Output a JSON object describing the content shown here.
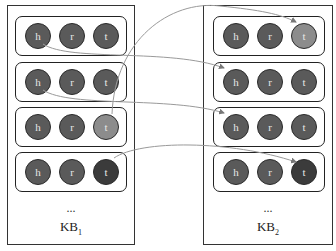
{
  "colors": {
    "normal": "#5a5a5a",
    "highlight": "#8c8c8c",
    "dark": "#3b3b3b",
    "link": "#9a9a9a"
  },
  "kb1": {
    "label_main": "KB",
    "label_sub": "1",
    "ellipsis": "...",
    "triples": [
      {
        "h": "h",
        "r": "r",
        "t": "t"
      },
      {
        "h": "h",
        "r": "r",
        "t": "t"
      },
      {
        "h": "h",
        "r": "r",
        "t": "t"
      },
      {
        "h": "h",
        "r": "r",
        "t": "t"
      }
    ]
  },
  "kb2": {
    "label_main": "KB",
    "label_sub": "2",
    "ellipsis": "...",
    "triples": [
      {
        "h": "h",
        "r": "r",
        "t": "t"
      },
      {
        "h": "h",
        "r": "r",
        "t": "t"
      },
      {
        "h": "h",
        "r": "r",
        "t": "t"
      },
      {
        "h": "h",
        "r": "r",
        "t": "t"
      }
    ]
  },
  "links": [
    {
      "from": "kb1.triple1.h",
      "to": "kb2.triple2.h"
    },
    {
      "from": "kb1.triple2.h",
      "to": "kb2.triple3.h"
    },
    {
      "from": "kb1.triple3.t",
      "to": "kb2.triple1.t"
    },
    {
      "from": "kb1.triple4.t",
      "to": "kb2.triple4.t"
    }
  ]
}
